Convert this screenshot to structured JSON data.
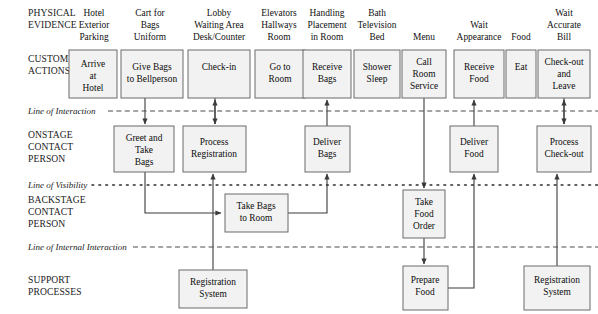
{
  "diagram": {
    "width": 598,
    "height": 314,
    "colors": {
      "box_fill": "#f2f2f2",
      "box_stroke": "#6b6b6b",
      "connector": "#3b3b3b",
      "text": "#0d0d0d",
      "background": "#ffffff"
    }
  },
  "row_labels": [
    {
      "id": "physical-evidence",
      "lines": [
        "PHYSICAL",
        "EVIDENCE"
      ]
    },
    {
      "id": "customer-actions",
      "lines": [
        "CUSTOMER",
        "ACTIONS"
      ]
    },
    {
      "id": "onstage-contact-person",
      "lines": [
        "ONSTAGE",
        "CONTACT",
        "PERSON"
      ]
    },
    {
      "id": "backstage-contact-person",
      "lines": [
        "BACKSTAGE",
        "CONTACT",
        "PERSON"
      ]
    },
    {
      "id": "support-processes",
      "lines": [
        "SUPPORT",
        "PROCESSES"
      ]
    }
  ],
  "separator_labels": [
    {
      "id": "line-of-interaction",
      "text": "Line of Interaction",
      "style": "dashed"
    },
    {
      "id": "line-of-visibility",
      "text": "Line of Visibility",
      "style": "dotted"
    },
    {
      "id": "line-of-internal-interaction",
      "text": "Line of Internal Interaction",
      "style": "dashed"
    }
  ],
  "physical_evidence": [
    {
      "id": "pe-hotel-exterior",
      "lines": [
        "Hotel",
        "Exterior",
        "Parking"
      ],
      "cx": 94
    },
    {
      "id": "pe-cart-for-bags",
      "lines": [
        "Cart for",
        "Bags",
        "Uniform"
      ],
      "cx": 148
    },
    {
      "id": "pe-lobby",
      "lines": [
        "Lobby",
        "Waiting Area",
        "Desk/Counter"
      ],
      "cx": 218
    },
    {
      "id": "pe-elevators",
      "lines": [
        "Elevators",
        "Hallways",
        "Room"
      ],
      "cx": 277
    },
    {
      "id": "pe-handling",
      "lines": [
        "Handling",
        "Placement",
        "in Room"
      ],
      "cx": 324
    },
    {
      "id": "pe-bath",
      "lines": [
        "Bath",
        "Television",
        "Bed"
      ],
      "cx": 375
    },
    {
      "id": "pe-menu",
      "lines": [
        "Menu"
      ],
      "cx": 423
    },
    {
      "id": "pe-wait-appearance",
      "lines": [
        "Wait",
        "Appearance"
      ],
      "cx": 479
    },
    {
      "id": "pe-food",
      "lines": [
        "Food"
      ],
      "cx": 521
    },
    {
      "id": "pe-wait-accurate-bill",
      "lines": [
        "Wait",
        "Accurate",
        "Bill"
      ],
      "cx": 562
    }
  ],
  "customer_actions": [
    {
      "id": "ca-arrive-at-hotel",
      "lines": [
        "Arrive",
        "at",
        "Hotel"
      ],
      "x": 69,
      "y": 50,
      "w": 48,
      "h": 48
    },
    {
      "id": "ca-give-bags",
      "lines": [
        "Give Bags",
        "to Bellperson"
      ],
      "x": 121,
      "y": 50,
      "w": 62,
      "h": 48
    },
    {
      "id": "ca-check-in",
      "lines": [
        "Check-in"
      ],
      "x": 188,
      "y": 50,
      "w": 62,
      "h": 48
    },
    {
      "id": "ca-go-to-room",
      "lines": [
        "Go to",
        "Room"
      ],
      "x": 255,
      "y": 50,
      "w": 50,
      "h": 48
    },
    {
      "id": "ca-receive-bags",
      "lines": [
        "Receive",
        "Bags"
      ],
      "x": 303,
      "y": 50,
      "w": 48,
      "h": 48
    },
    {
      "id": "ca-shower-sleep",
      "lines": [
        "Shower",
        "Sleep"
      ],
      "x": 354,
      "y": 50,
      "w": 46,
      "h": 48
    },
    {
      "id": "ca-call-room-service",
      "lines": [
        "Call",
        "Room",
        "Service"
      ],
      "x": 402,
      "y": 50,
      "w": 44,
      "h": 48
    },
    {
      "id": "ca-receive-food",
      "lines": [
        "Receive",
        "Food"
      ],
      "x": 454,
      "y": 50,
      "w": 50,
      "h": 48
    },
    {
      "id": "ca-eat",
      "lines": [
        "Eat"
      ],
      "x": 506,
      "y": 50,
      "w": 30,
      "h": 48
    },
    {
      "id": "ca-check-out-and-leave",
      "lines": [
        "Check-out",
        "and",
        "Leave"
      ],
      "x": 538,
      "y": 50,
      "w": 52,
      "h": 48
    }
  ],
  "onstage_actions": [
    {
      "id": "os-greet-and-take-bags",
      "lines": [
        "Greet and",
        "Take",
        "Bags"
      ],
      "x": 114,
      "y": 126,
      "w": 60,
      "h": 46
    },
    {
      "id": "os-process-registration",
      "lines": [
        "Process",
        "Registration"
      ],
      "x": 183,
      "y": 126,
      "w": 63,
      "h": 46
    },
    {
      "id": "os-deliver-bags",
      "lines": [
        "Deliver",
        "Bags"
      ],
      "x": 305,
      "y": 126,
      "w": 45,
      "h": 46
    },
    {
      "id": "os-deliver-food",
      "lines": [
        "Deliver",
        "Food"
      ],
      "x": 450,
      "y": 126,
      "w": 48,
      "h": 46
    },
    {
      "id": "os-process-check-out",
      "lines": [
        "Process",
        "Check-out"
      ],
      "x": 537,
      "y": 126,
      "w": 54,
      "h": 46
    }
  ],
  "backstage_actions": [
    {
      "id": "bs-take-bags-to-room",
      "lines": [
        "Take Bags",
        "to Room"
      ],
      "x": 225,
      "y": 194,
      "w": 63,
      "h": 38
    },
    {
      "id": "bs-take-food-order",
      "lines": [
        "Take",
        "Food",
        "Order"
      ],
      "x": 403,
      "y": 190,
      "w": 42,
      "h": 48
    }
  ],
  "support_processes": [
    {
      "id": "sp-registration-system-left",
      "lines": [
        "Registration",
        "System"
      ],
      "x": 179,
      "y": 270,
      "w": 68,
      "h": 38
    },
    {
      "id": "sp-prepare-food",
      "lines": [
        "Prepare",
        "Food"
      ],
      "x": 403,
      "y": 266,
      "w": 45,
      "h": 44
    },
    {
      "id": "sp-registration-system-right",
      "lines": [
        "Registration",
        "System"
      ],
      "x": 524,
      "y": 266,
      "w": 66,
      "h": 44
    }
  ],
  "connectors": [
    {
      "id": "conn-give-bags-to-greet",
      "from": "ca-give-bags",
      "to": "os-greet-and-take-bags"
    },
    {
      "id": "conn-check-in-to-process-registration",
      "from": "ca-check-in",
      "to": "os-process-registration",
      "bidirectional": true
    },
    {
      "id": "conn-greet-to-take-bags-to-room",
      "from": "os-greet-and-take-bags",
      "to": "bs-take-bags-to-room"
    },
    {
      "id": "conn-process-registration-to-registration-system",
      "from": "sp-registration-system-left",
      "to": "os-process-registration"
    },
    {
      "id": "conn-take-bags-to-room-to-deliver-bags",
      "from": "bs-take-bags-to-room",
      "to": "os-deliver-bags"
    },
    {
      "id": "conn-deliver-bags-to-receive-bags",
      "from": "os-deliver-bags",
      "to": "ca-receive-bags"
    },
    {
      "id": "conn-call-room-service-to-take-food-order",
      "from": "ca-call-room-service",
      "to": "bs-take-food-order"
    },
    {
      "id": "conn-take-food-order-to-prepare-food",
      "from": "bs-take-food-order",
      "to": "sp-prepare-food"
    },
    {
      "id": "conn-prepare-food-to-deliver-food",
      "from": "sp-prepare-food",
      "to": "os-deliver-food"
    },
    {
      "id": "conn-deliver-food-to-receive-food",
      "from": "os-deliver-food",
      "to": "ca-receive-food"
    },
    {
      "id": "conn-check-out-to-process-check-out",
      "from": "ca-check-out-and-leave",
      "to": "os-process-check-out",
      "bidirectional": true
    },
    {
      "id": "conn-registration-system-to-process-check-out",
      "from": "sp-registration-system-right",
      "to": "os-process-check-out"
    }
  ]
}
